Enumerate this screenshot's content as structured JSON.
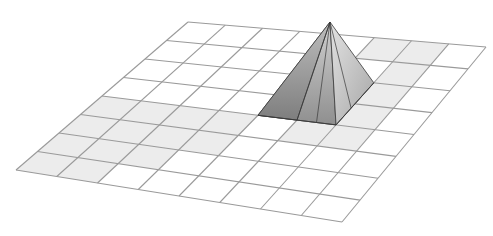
{
  "figure": {
    "grid": {
      "divisions": 8,
      "corners": {
        "top_left": [
          188,
          22
        ],
        "top_right": [
          486,
          47
        ],
        "bottom_left": [
          16,
          170
        ],
        "bottom_right": [
          342,
          222
        ]
      },
      "line_color": "#9a9a9a",
      "cell_fill": "#ffffff",
      "shaded_fill": "#ececec",
      "shaded_cells": [
        [
          0,
          4
        ],
        [
          1,
          4
        ],
        [
          2,
          4
        ],
        [
          3,
          4
        ],
        [
          0,
          5
        ],
        [
          1,
          5
        ],
        [
          2,
          5
        ],
        [
          3,
          5
        ],
        [
          0,
          6
        ],
        [
          1,
          6
        ],
        [
          2,
          6
        ],
        [
          0,
          7
        ],
        [
          1,
          7
        ],
        [
          6,
          1
        ],
        [
          6,
          2
        ],
        [
          5,
          0
        ],
        [
          6,
          0
        ],
        [
          6,
          3
        ],
        [
          5,
          4
        ],
        [
          6,
          4
        ]
      ]
    },
    "pyramid": {
      "apex": [
        330,
        22
      ],
      "base_cells": {
        "u": [
          4,
          6
        ],
        "v": [
          2,
          4
        ]
      },
      "face_colors": {
        "left": "#8c8c8c",
        "front": "#a8a8a8",
        "right": "#c4c4c4",
        "back": "#d8d8d8"
      },
      "edge_color": "#3a3a3a"
    }
  }
}
